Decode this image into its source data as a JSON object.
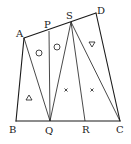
{
  "diagram": {
    "type": "geometry-figure",
    "points": {
      "A": {
        "label": "A",
        "x": 24,
        "y": 38
      },
      "P": {
        "label": "P",
        "x": 49,
        "y": 31
      },
      "S": {
        "label": "S",
        "x": 71,
        "y": 22
      },
      "D": {
        "label": "D",
        "x": 96,
        "y": 13
      },
      "B": {
        "label": "B",
        "x": 16,
        "y": 121
      },
      "Q": {
        "label": "Q",
        "x": 50,
        "y": 121
      },
      "R": {
        "label": "R",
        "x": 85,
        "y": 121
      },
      "C": {
        "label": "C",
        "x": 120,
        "y": 121
      }
    },
    "segments": [
      "AB",
      "BC",
      "CD",
      "DA",
      "AQ",
      "PQ",
      "SQ",
      "SR",
      "SC"
    ],
    "region_markers": [
      {
        "symbol": "circle",
        "x": 39,
        "y": 53
      },
      {
        "symbol": "circle",
        "x": 57,
        "y": 47
      },
      {
        "symbol": "triangle-down",
        "x": 92,
        "y": 44
      },
      {
        "symbol": "triangle",
        "x": 29,
        "y": 98
      },
      {
        "symbol": "cross",
        "x": 66,
        "y": 90
      },
      {
        "symbol": "cross",
        "x": 92,
        "y": 90
      }
    ]
  }
}
